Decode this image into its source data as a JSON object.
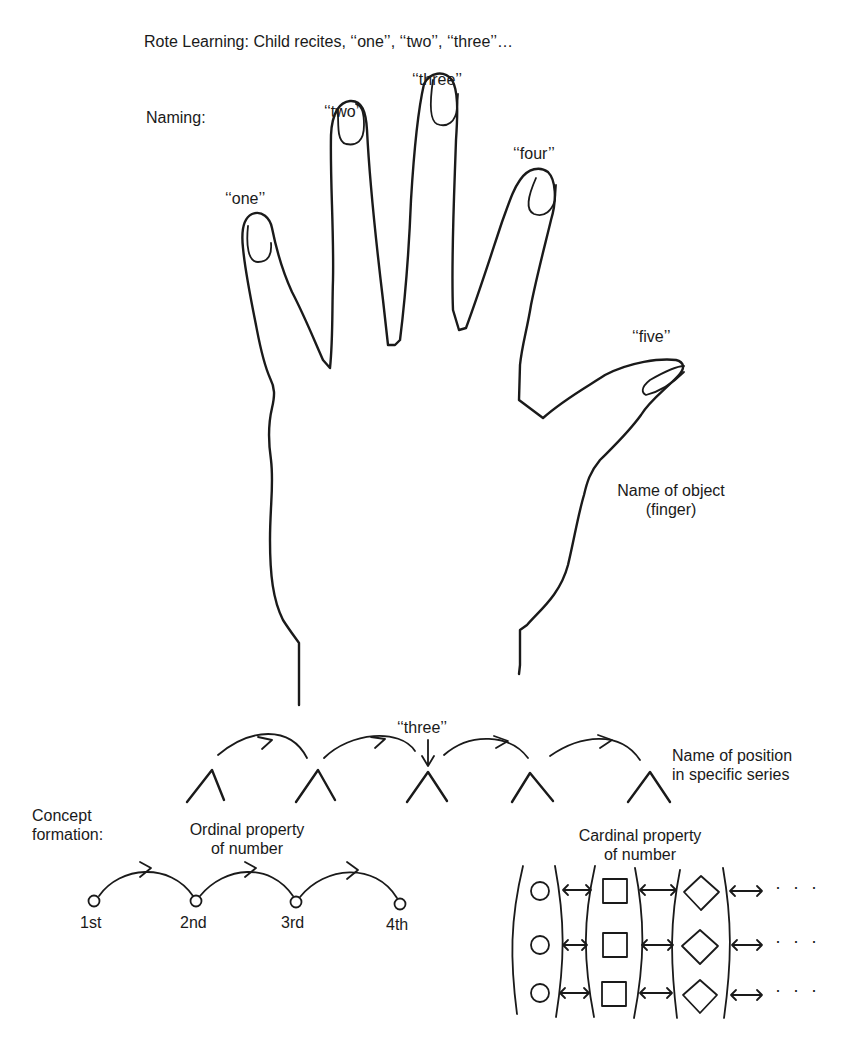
{
  "diagram": {
    "rote_learning": "Rote Learning: Child recites, ‘‘one’’, ‘‘two’’, ‘‘three’’…",
    "naming_label": "Naming:",
    "fingers": [
      {
        "id": "index",
        "label": "‘‘one’’"
      },
      {
        "id": "middle",
        "label": "‘‘two’’"
      },
      {
        "id": "ring",
        "label": "‘‘three’’"
      },
      {
        "id": "little",
        "label": "‘‘four’’"
      },
      {
        "id": "thumb",
        "label": "‘‘five’’"
      }
    ],
    "name_of_object": "Name of object\n(finger)",
    "position_series": {
      "pointer_label": "‘‘three’’",
      "caption": "Name of position\nin specific series",
      "nodes": 5
    },
    "concept_formation_label": "Concept\nformation:",
    "ordinal": {
      "caption": "Ordinal property\nof number",
      "positions": [
        "1st",
        "2nd",
        "3rd",
        "4th"
      ]
    },
    "cardinal": {
      "caption": "Cardinal property\nof number",
      "sets": [
        "circle",
        "square",
        "diamond"
      ],
      "rows": 3,
      "continuation": "···"
    }
  }
}
